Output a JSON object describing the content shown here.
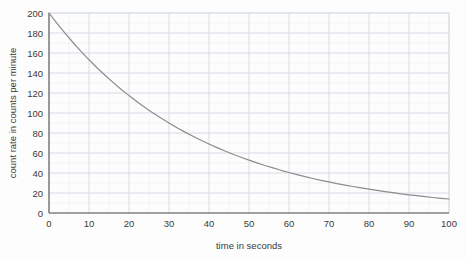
{
  "chart_data": {
    "type": "line",
    "title": "",
    "xlabel": "time in seconds",
    "ylabel": "count rate in counts per minute",
    "xlim": [
      0,
      100
    ],
    "ylim": [
      0,
      200
    ],
    "xticks": [
      0,
      10,
      20,
      30,
      40,
      50,
      60,
      70,
      80,
      90,
      100
    ],
    "yticks": [
      0,
      20,
      40,
      60,
      80,
      100,
      120,
      140,
      160,
      180,
      200
    ],
    "xtick_labels": [
      "0",
      "10",
      "20",
      "30",
      "40",
      "50",
      "60",
      "70",
      "80",
      "90",
      "100"
    ],
    "ytick_labels": [
      "0",
      "20",
      "40",
      "60",
      "80",
      "100",
      "120",
      "140",
      "160",
      "180",
      "200"
    ],
    "grid": true,
    "grid_minor": true,
    "grid_minor_step_x": 5,
    "grid_minor_step_y": 10,
    "legend": null,
    "legend_position": "none",
    "annotations": [],
    "series": [
      {
        "name": "count rate",
        "color": "#8c8c8c",
        "line_width": 1.2,
        "x": [
          0,
          2,
          4,
          6,
          8,
          10,
          12,
          14,
          16,
          18,
          20,
          22,
          24,
          26,
          28,
          30,
          32,
          34,
          36,
          38,
          40,
          42,
          44,
          46,
          48,
          50,
          52,
          54,
          56,
          58,
          60,
          62,
          64,
          66,
          68,
          70,
          72,
          74,
          76,
          78,
          80,
          82,
          84,
          86,
          88,
          90,
          92,
          94,
          96,
          98,
          100
        ],
        "values": [
          200.0,
          189.6,
          179.8,
          170.5,
          161.6,
          153.2,
          145.3,
          137.8,
          130.6,
          123.8,
          117.4,
          111.3,
          105.6,
          100.1,
          94.9,
          90.0,
          85.3,
          80.9,
          76.7,
          72.7,
          69.0,
          65.4,
          62.0,
          58.8,
          55.8,
          52.9,
          50.1,
          47.5,
          45.1,
          42.7,
          40.5,
          38.4,
          36.4,
          34.5,
          32.7,
          31.1,
          29.4,
          27.9,
          26.5,
          25.1,
          23.8,
          22.6,
          21.4,
          20.3,
          19.2,
          18.2,
          17.3,
          16.4,
          15.5,
          14.7,
          14.0
        ]
      }
    ]
  },
  "axes": {
    "x_title": "time in seconds",
    "y_title": "count rate in counts per minute"
  },
  "colors": {
    "curve": "#8c8c8c",
    "axis": "#555555",
    "grid_major": "#d6dce6",
    "grid_minor": "#e9eef5",
    "text": "#3a3a3a",
    "background": "#fdfdfd"
  }
}
